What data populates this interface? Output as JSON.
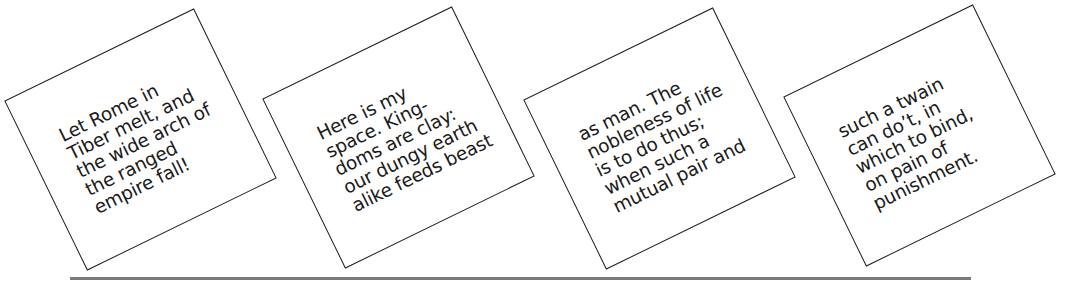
{
  "cards": [
    {
      "lines": [
        "Let Rome in",
        "Tiber melt, and",
        "the wide arch of",
        "the ranged",
        "empire fall!"
      ]
    },
    {
      "lines": [
        "Here is my",
        "space. King-",
        "doms are clay:",
        "our dungy earth",
        "alike feeds beast"
      ]
    },
    {
      "lines": [
        "as man. The",
        "nobleness of life",
        "is to do thus;",
        "when such a",
        "mutual pair and"
      ]
    },
    {
      "lines": [
        "such a twain",
        "can do’t, in",
        "which to bind,",
        "on pain of",
        "punishment."
      ]
    }
  ],
  "rule": {
    "color": "#7a7a7a"
  }
}
